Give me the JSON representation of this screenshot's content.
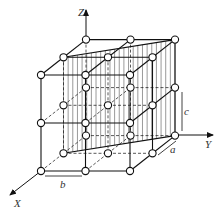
{
  "diagram": {
    "axes": {
      "x_label": "X",
      "y_label": "Y",
      "z_label": "Z"
    },
    "dimensions": {
      "a_label": "a",
      "b_label": "b",
      "c_label": "c"
    },
    "colors": {
      "line": "#111111",
      "hatch": "#555555",
      "node_fill": "#ffffff"
    }
  }
}
